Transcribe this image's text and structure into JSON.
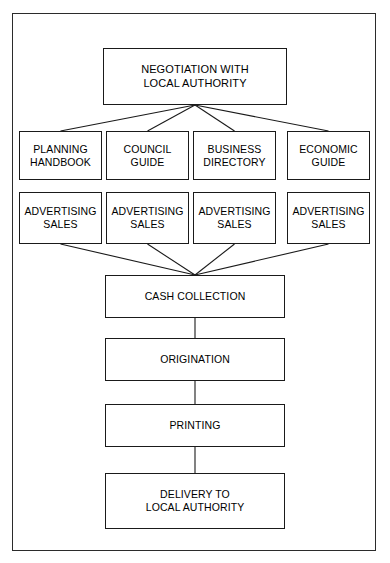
{
  "diagram": {
    "frame": {
      "visible": true,
      "border_color": "#2b2b2b"
    },
    "line_color": "#1a1a1a",
    "text_color": "#000000",
    "background_color": "#ffffff",
    "nodes": {
      "top": {
        "label": "NEGOTIATION WITH\nLOCAL AUTHORITY"
      },
      "publications": [
        {
          "label": "PLANNING\nHANDBOOK"
        },
        {
          "label": "COUNCIL\nGUIDE"
        },
        {
          "label": "BUSINESS\nDIRECTORY"
        },
        {
          "label": "ECONOMIC\nGUIDE"
        }
      ],
      "advertising": [
        {
          "label": "ADVERTISING\nSALES"
        },
        {
          "label": "ADVERTISING\nSALES"
        },
        {
          "label": "ADVERTISING\nSALES"
        },
        {
          "label": "ADVERTISING\nSALES"
        }
      ],
      "stages": [
        {
          "label": "CASH COLLECTION"
        },
        {
          "label": "ORIGINATION"
        },
        {
          "label": "PRINTING"
        },
        {
          "label": "DELIVERY TO\nLOCAL AUTHORITY"
        }
      ]
    },
    "connections": [
      {
        "from": "NEGOTIATION WITH LOCAL AUTHORITY",
        "to": "PLANNING HANDBOOK",
        "style": "fan-out"
      },
      {
        "from": "NEGOTIATION WITH LOCAL AUTHORITY",
        "to": "COUNCIL GUIDE",
        "style": "fan-out"
      },
      {
        "from": "NEGOTIATION WITH LOCAL AUTHORITY",
        "to": "BUSINESS DIRECTORY",
        "style": "fan-out"
      },
      {
        "from": "NEGOTIATION WITH LOCAL AUTHORITY",
        "to": "ECONOMIC GUIDE",
        "style": "fan-out"
      },
      {
        "from": "ADVERTISING SALES 1",
        "to": "CASH COLLECTION",
        "style": "fan-in"
      },
      {
        "from": "ADVERTISING SALES 2",
        "to": "CASH COLLECTION",
        "style": "fan-in"
      },
      {
        "from": "ADVERTISING SALES 3",
        "to": "CASH COLLECTION",
        "style": "fan-in"
      },
      {
        "from": "ADVERTISING SALES 4",
        "to": "CASH COLLECTION",
        "style": "fan-in"
      },
      {
        "from": "CASH COLLECTION",
        "to": "ORIGINATION",
        "style": "vertical"
      },
      {
        "from": "ORIGINATION",
        "to": "PRINTING",
        "style": "vertical"
      },
      {
        "from": "PRINTING",
        "to": "DELIVERY TO LOCAL AUTHORITY",
        "style": "vertical"
      }
    ]
  }
}
